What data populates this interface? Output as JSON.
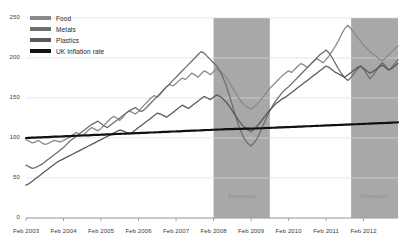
{
  "chart_data": {
    "type": "line",
    "title": "",
    "xlabel": "",
    "ylabel": "",
    "ylim": [
      0,
      250
    ],
    "yticks": [
      0,
      50,
      100,
      150,
      200,
      250
    ],
    "xticks": [
      "Feb 2003",
      "Feb 2004",
      "Feb 2005",
      "Feb 2006",
      "Feb 2007",
      "Feb 2008",
      "Feb 2009",
      "Feb 2010",
      "Feb 2011",
      "Feb 2012"
    ],
    "grid": true,
    "legend_position": "top-left",
    "legend": [
      "Food",
      "Metals",
      "Plastics",
      "UK Inflation rate"
    ],
    "colors": {
      "food": "#8a8a8a",
      "metals": "#6e6e6e",
      "plastics": "#5a5a5a",
      "uk_inflation_rate": "#111111",
      "recession_band": "#a8a8a8",
      "gridline": "#d8d8d8",
      "axis": "#8c8c8c"
    },
    "annotations": [
      {
        "label": "Recession",
        "x_start": "Feb 2008",
        "x_end": "Aug 2009"
      },
      {
        "label": "Recession",
        "x_start": "Sep 2011",
        "x_end": "Feb 2012"
      }
    ],
    "series": [
      {
        "name": "Food",
        "color": "#8a8a8a",
        "values": [
          98,
          96,
          94,
          95,
          97,
          94,
          92,
          93,
          95,
          97,
          96,
          95,
          97,
          99,
          101,
          104,
          107,
          105,
          103,
          106,
          110,
          113,
          111,
          109,
          112,
          116,
          120,
          124,
          127,
          125,
          122,
          126,
          131,
          134,
          132,
          130,
          133,
          138,
          142,
          146,
          150,
          153,
          151,
          155,
          160,
          164,
          167,
          165,
          168,
          172,
          175,
          173,
          177,
          181,
          179,
          176,
          180,
          184,
          182,
          179,
          183,
          187,
          184,
          180,
          176,
          170,
          163,
          157,
          150,
          145,
          141,
          138,
          136,
          139,
          143,
          147,
          152,
          157,
          162,
          166,
          170,
          174,
          178,
          181,
          184,
          182,
          186,
          190,
          193,
          191,
          188,
          192,
          196,
          199,
          197,
          194,
          198,
          203,
          209,
          215,
          222,
          230,
          237,
          241,
          236,
          231,
          226,
          221,
          216,
          212,
          208,
          205,
          202,
          199,
          197,
          200,
          204,
          208,
          212,
          215
        ]
      },
      {
        "name": "Metals",
        "color": "#6e6e6e",
        "values": [
          66,
          64,
          62,
          63,
          65,
          67,
          70,
          73,
          76,
          79,
          82,
          85,
          88,
          92,
          96,
          99,
          102,
          105,
          108,
          111,
          114,
          117,
          119,
          121,
          118,
          115,
          113,
          116,
          119,
          122,
          125,
          128,
          131,
          134,
          136,
          138,
          135,
          133,
          136,
          140,
          144,
          148,
          152,
          156,
          160,
          164,
          168,
          172,
          176,
          180,
          184,
          188,
          192,
          196,
          200,
          204,
          208,
          206,
          202,
          198,
          194,
          190,
          184,
          176,
          166,
          154,
          141,
          128,
          116,
          106,
          98,
          93,
          90,
          94,
          100,
          108,
          117,
          126,
          134,
          141,
          147,
          152,
          157,
          161,
          164,
          168,
          172,
          176,
          180,
          184,
          188,
          192,
          196,
          200,
          204,
          207,
          210,
          206,
          200,
          193,
          186,
          180,
          175,
          172,
          176,
          181,
          186,
          190,
          186,
          180,
          174,
          178,
          184,
          190,
          194,
          190,
          185,
          188,
          193,
          198
        ]
      },
      {
        "name": "Plastics",
        "color": "#5a5a5a",
        "values": [
          41,
          43,
          46,
          49,
          52,
          55,
          58,
          61,
          64,
          67,
          70,
          72,
          74,
          76,
          78,
          80,
          82,
          84,
          86,
          88,
          90,
          92,
          94,
          96,
          98,
          100,
          102,
          104,
          106,
          108,
          110,
          109,
          107,
          105,
          107,
          110,
          113,
          116,
          119,
          122,
          125,
          128,
          131,
          130,
          128,
          126,
          129,
          132,
          135,
          138,
          141,
          139,
          137,
          140,
          143,
          146,
          149,
          152,
          150,
          148,
          151,
          154,
          152,
          149,
          145,
          140,
          134,
          128,
          122,
          117,
          113,
          110,
          108,
          111,
          115,
          120,
          125,
          130,
          135,
          139,
          143,
          146,
          149,
          151,
          154,
          157,
          160,
          163,
          166,
          169,
          172,
          175,
          178,
          181,
          184,
          187,
          190,
          188,
          185,
          182,
          180,
          178,
          176,
          179,
          182,
          185,
          188,
          190,
          187,
          184,
          181,
          183,
          186,
          189,
          191,
          188,
          185,
          187,
          190,
          193
        ]
      },
      {
        "name": "UK Inflation rate",
        "color": "#111111",
        "values": [
          100,
          100.2,
          100.4,
          100.5,
          100.7,
          100.9,
          101.1,
          101.2,
          101.4,
          101.6,
          101.7,
          101.9,
          102.1,
          102.3,
          102.4,
          102.6,
          102.8,
          102.9,
          103.1,
          103.3,
          103.4,
          103.6,
          103.8,
          104.0,
          104.1,
          104.3,
          104.5,
          104.6,
          104.8,
          105.0,
          105.2,
          105.3,
          105.5,
          105.7,
          105.8,
          106.0,
          106.2,
          106.4,
          106.5,
          106.7,
          106.9,
          107.0,
          107.2,
          107.4,
          107.6,
          107.7,
          107.9,
          108.1,
          108.2,
          108.4,
          108.6,
          108.8,
          108.9,
          109.1,
          109.3,
          109.4,
          109.6,
          109.8,
          110.0,
          110.1,
          110.3,
          110.5,
          110.6,
          110.8,
          111.0,
          111.1,
          111.2,
          111.3,
          111.4,
          111.5,
          111.6,
          111.7,
          111.8,
          111.9,
          112.0,
          112.2,
          112.3,
          112.5,
          112.7,
          112.8,
          113.0,
          113.2,
          113.3,
          113.5,
          113.7,
          113.8,
          114.0,
          114.2,
          114.3,
          114.5,
          114.7,
          114.8,
          115.0,
          115.2,
          115.3,
          115.5,
          115.7,
          115.8,
          116.0,
          116.2,
          116.3,
          116.5,
          116.7,
          116.8,
          117.0,
          117.2,
          117.3,
          117.5,
          117.7,
          117.8,
          118.0,
          118.2,
          118.3,
          118.5,
          118.7,
          118.8,
          119.0,
          119.2,
          119.4,
          119.6
        ]
      }
    ]
  },
  "axis": {
    "y_labels": [
      "250",
      "200",
      "150",
      "100",
      "50",
      "0"
    ],
    "x_labels": [
      "Feb 2003",
      "Feb 2004",
      "Feb 2005",
      "Feb 2006",
      "Feb 2007",
      "Feb 2008",
      "Feb 2009",
      "Feb 2010",
      "Feb 2011",
      "Feb 2012"
    ]
  },
  "legend": {
    "items": [
      {
        "label": "Food"
      },
      {
        "label": "Metals"
      },
      {
        "label": "Plastics"
      },
      {
        "label": "UK Inflation rate"
      }
    ]
  },
  "recessions": [
    {
      "label": "Recession"
    },
    {
      "label": "Recession"
    }
  ]
}
